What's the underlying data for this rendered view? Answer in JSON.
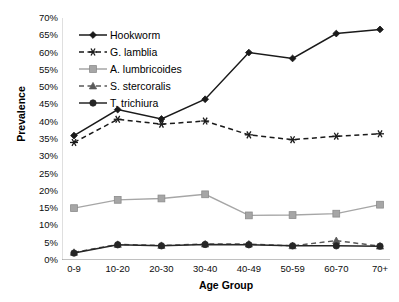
{
  "chart_data": {
    "type": "line",
    "title": "",
    "xlabel": "Age Group",
    "ylabel": "Prevalence",
    "categories": [
      "0-9",
      "10-20",
      "20-30",
      "30-40",
      "40-49",
      "50-59",
      "60-70",
      "70+"
    ],
    "ylim": [
      0,
      70
    ],
    "ytick_step": 5,
    "ytick_labels": [
      "70%",
      "65%",
      "60%",
      "55%",
      "50%",
      "45%",
      "40%",
      "35%",
      "30%",
      "25%",
      "20%",
      "15%",
      "10%",
      "5%",
      "0%"
    ],
    "ytick_values": [
      70,
      65,
      60,
      55,
      50,
      45,
      40,
      35,
      30,
      25,
      20,
      15,
      10,
      5,
      0
    ],
    "grid": false,
    "legend_position": "top-left-inside",
    "series": [
      {
        "name": "Hookworm",
        "values": [
          36,
          43.5,
          40.8,
          46.5,
          60,
          58.3,
          65.5,
          66.7
        ],
        "color": "#1a1a1a",
        "dash": "solid",
        "marker": "diamond"
      },
      {
        "name": "G. lamblia",
        "values": [
          34,
          40.7,
          39.3,
          40.2,
          36.2,
          34.8,
          35.8,
          36.5
        ],
        "color": "#1a1a1a",
        "dash": "dashed",
        "marker": "asterisk"
      },
      {
        "name": "A. lumbricoides",
        "values": [
          15,
          17.4,
          17.8,
          19,
          12.9,
          13,
          13.4,
          16
        ],
        "color": "#a6a6a6",
        "dash": "solid",
        "marker": "square"
      },
      {
        "name": "S. stercoralis",
        "values": [
          2.2,
          4.5,
          4.2,
          4.6,
          4.6,
          4.1,
          5.6,
          4
        ],
        "color": "#595959",
        "dash": "dashed",
        "marker": "triangle"
      },
      {
        "name": "T. trichiura",
        "values": [
          2,
          4.4,
          4.1,
          4.5,
          4.4,
          4.1,
          4.1,
          4
        ],
        "color": "#262626",
        "dash": "solid",
        "marker": "circle"
      }
    ]
  }
}
